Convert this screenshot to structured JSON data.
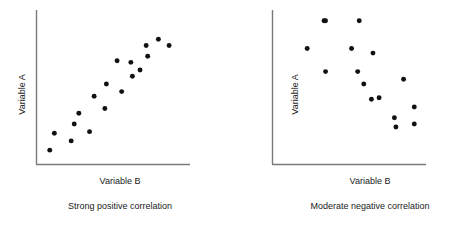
{
  "figure": {
    "background": "#ffffff",
    "axis_color": "#7a7a7a",
    "point_color": "#111111"
  },
  "panels": [
    {
      "id": "left",
      "caption": "Strong positive correlation",
      "xlabel": "Variable B",
      "ylabel": "Variable A"
    },
    {
      "id": "right",
      "caption": "Moderate negative correlation",
      "xlabel": "Variable B",
      "ylabel": "Variable A"
    }
  ],
  "chart_data": [
    {
      "type": "scatter",
      "title": "Strong positive correlation",
      "xlabel": "Variable B",
      "ylabel": "Variable A",
      "xlim": [
        0,
        100
      ],
      "ylim": [
        0,
        100
      ],
      "grid": false,
      "legend": "none",
      "axis_ticks": false,
      "marker": {
        "shape": "circle",
        "size": 3,
        "color": "#111111"
      },
      "points": [
        {
          "x": 9,
          "y": 9
        },
        {
          "x": 12,
          "y": 20
        },
        {
          "x": 23,
          "y": 15
        },
        {
          "x": 25,
          "y": 26
        },
        {
          "x": 28,
          "y": 33
        },
        {
          "x": 35,
          "y": 21
        },
        {
          "x": 38,
          "y": 44
        },
        {
          "x": 45,
          "y": 36
        },
        {
          "x": 46,
          "y": 52
        },
        {
          "x": 53,
          "y": 67
        },
        {
          "x": 56,
          "y": 47
        },
        {
          "x": 62,
          "y": 66
        },
        {
          "x": 63,
          "y": 57
        },
        {
          "x": 68,
          "y": 61
        },
        {
          "x": 72,
          "y": 77
        },
        {
          "x": 73,
          "y": 70
        },
        {
          "x": 80,
          "y": 81
        },
        {
          "x": 87,
          "y": 77
        }
      ]
    },
    {
      "type": "scatter",
      "title": "Moderate negative correlation",
      "xlabel": "Variable B",
      "ylabel": "Variable A",
      "xlim": [
        0,
        100
      ],
      "ylim": [
        0,
        100
      ],
      "grid": false,
      "legend": "none",
      "axis_ticks": false,
      "marker": {
        "shape": "circle",
        "size": 3,
        "color": "#111111"
      },
      "points": [
        {
          "x": 23,
          "y": 75
        },
        {
          "x": 34,
          "y": 93
        },
        {
          "x": 35,
          "y": 60
        },
        {
          "x": 35,
          "y": 93
        },
        {
          "x": 52,
          "y": 75
        },
        {
          "x": 56,
          "y": 60
        },
        {
          "x": 57,
          "y": 93
        },
        {
          "x": 60,
          "y": 52
        },
        {
          "x": 65,
          "y": 42
        },
        {
          "x": 66,
          "y": 72
        },
        {
          "x": 70,
          "y": 43
        },
        {
          "x": 80,
          "y": 30
        },
        {
          "x": 81,
          "y": 24
        },
        {
          "x": 86,
          "y": 55
        },
        {
          "x": 93,
          "y": 37
        },
        {
          "x": 93,
          "y": 26
        }
      ]
    }
  ]
}
